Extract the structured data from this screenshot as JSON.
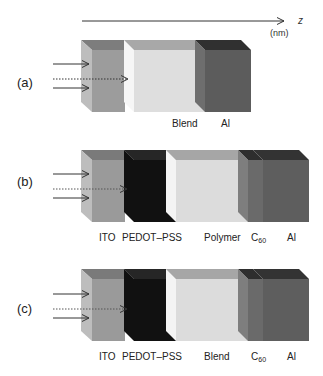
{
  "axis": {
    "variable": "z",
    "unit": "(nm)"
  },
  "colors": {
    "ito_front": "#9a9a9a",
    "ito_top": "#7a7a7a",
    "ito_side": "#bdbdbd",
    "pedot_front": "#111111",
    "pedot_top": "#2a2a2a",
    "active_front": "#dcdcdc",
    "active_top": "#a8a8a8",
    "active_side": "#f4f4f4",
    "c60_front": "#6a6a6a",
    "c60_side": "#7e7e7e",
    "al_front": "#5e5e5e",
    "al_top": "#333333",
    "al_side": "#6e6e6e",
    "arrow": "#333333"
  },
  "panels": [
    {
      "id": "a",
      "label": "(a)",
      "layers": [
        "",
        "Blend",
        "Al"
      ]
    },
    {
      "id": "b",
      "label": "(b)",
      "layers": [
        "ITO",
        "PEDOT–PSS",
        "Polymer",
        "C",
        "Al"
      ],
      "c60_sub": "60"
    },
    {
      "id": "c",
      "label": "(c)",
      "layers": [
        "ITO",
        "PEDOT–PSS",
        "Blend",
        "C",
        "Al"
      ],
      "c60_sub": "60"
    }
  ]
}
